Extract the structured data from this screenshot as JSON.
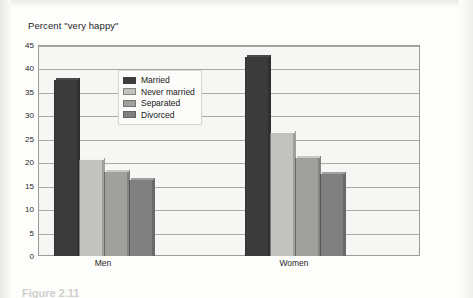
{
  "chart_data": {
    "type": "bar",
    "title": "Percent \"very happy\"",
    "xlabel": "",
    "ylabel": "",
    "ylim": [
      0,
      45
    ],
    "ytick_step": 5,
    "yticks": [
      "45",
      "40",
      "35",
      "30",
      "25",
      "20",
      "15",
      "10",
      "5",
      "0"
    ],
    "grid": true,
    "legend_position": "inside-upper-left",
    "categories": [
      "Men",
      "Women"
    ],
    "series": [
      {
        "name": "Married",
        "values": [
          37.5,
          42.5
        ],
        "color": "#3b3b3b"
      },
      {
        "name": "Never married",
        "values": [
          20.5,
          26.3
        ],
        "color": "#c2c2c0"
      },
      {
        "name": "Separated",
        "values": [
          18.0,
          21.0
        ],
        "color": "#a0a09e"
      },
      {
        "name": "Divorced",
        "values": [
          16.3,
          17.5
        ],
        "color": "#808080"
      }
    ]
  },
  "caption": {
    "text": "Figure 2.11"
  }
}
